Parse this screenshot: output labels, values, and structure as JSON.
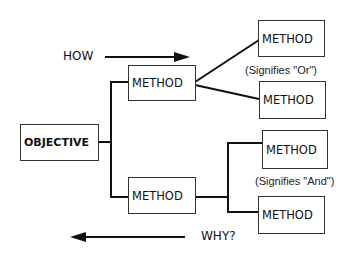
{
  "diagram": {
    "type": "objective-method tree",
    "objective": {
      "label": "OBJECTIVE"
    },
    "methods_level1": [
      {
        "label": "METHOD"
      },
      {
        "label": "METHOD"
      }
    ],
    "or_group": {
      "methods": [
        {
          "label": "METHOD"
        },
        {
          "label": "METHOD"
        }
      ],
      "note": "(Signifies \"Or\")"
    },
    "and_group": {
      "methods": [
        {
          "label": "METHOD"
        },
        {
          "label": "METHOD"
        }
      ],
      "note": "(Signifies \"And\")"
    },
    "how_arrow": {
      "label": "HOW",
      "direction": "right"
    },
    "why_arrow": {
      "label": "WHY?",
      "direction": "left"
    }
  }
}
